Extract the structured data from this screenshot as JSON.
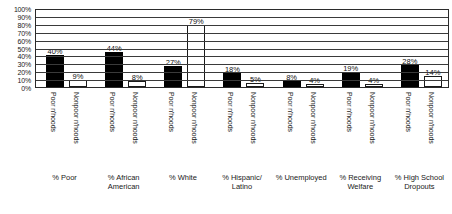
{
  "chart_data": {
    "type": "bar",
    "title": "",
    "subtitle": "",
    "xlabel": "",
    "ylabel": "",
    "ylim": [
      0,
      100
    ],
    "grid": true,
    "legend_position": "none",
    "y_ticks": [
      "0%",
      "10%",
      "20%",
      "30%",
      "40%",
      "50%",
      "60%",
      "70%",
      "80%",
      "90%",
      "100%"
    ],
    "y_tick_values": [
      0,
      10,
      20,
      30,
      40,
      50,
      60,
      70,
      80,
      90,
      100
    ],
    "categories": [
      "% Poor",
      "% African American",
      "% White",
      "% Hispanic/ Latino",
      "% Unemployed",
      "% Receiving Welfare",
      "% High School Dropouts"
    ],
    "series": [
      {
        "name": "Poor n'hoods",
        "style": "filled-black",
        "values": [
          40,
          44,
          27,
          18,
          8,
          19,
          28
        ],
        "labels": [
          "40%",
          "44%",
          "27%",
          "18%",
          "8%",
          "19%",
          "28%"
        ]
      },
      {
        "name": "Nonpoor n'hoods",
        "style": "outlined-white",
        "values": [
          9,
          8,
          79,
          5,
          4,
          4,
          14
        ],
        "labels": [
          "9%",
          "8%",
          "79%",
          "5%",
          "4%",
          "4%",
          "14%"
        ]
      }
    ]
  },
  "colors": {
    "poor_bar": "#000000",
    "nonpoor_bar": "#ffffff",
    "bar_outline": "#1a1a1a",
    "gridline": "#3a3a3a",
    "plot_border": "#2b2b2b",
    "text": "#1a1a1a",
    "background": "#ffffff"
  }
}
